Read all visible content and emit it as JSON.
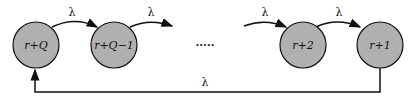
{
  "diagram": {
    "type": "state-transition-chain",
    "nodes": [
      {
        "id": "n1",
        "label": "r+Q"
      },
      {
        "id": "n2",
        "label": "r+Q−1"
      },
      {
        "id": "n3",
        "label": "r+2"
      },
      {
        "id": "n4",
        "label": "r+1"
      }
    ],
    "ellipsis": "·····",
    "edges": [
      {
        "from": "n1",
        "to": "n2",
        "label": "λ"
      },
      {
        "from": "n2",
        "to": "ellipsis",
        "label": "λ"
      },
      {
        "from": "ellipsis",
        "to": "n3",
        "label": "λ"
      },
      {
        "from": "n3",
        "to": "n4",
        "label": "λ"
      },
      {
        "from": "n4",
        "to": "n1",
        "label": "λ"
      }
    ],
    "colors": {
      "node_fill": "#b0b0b0",
      "stroke": "#111111"
    }
  }
}
